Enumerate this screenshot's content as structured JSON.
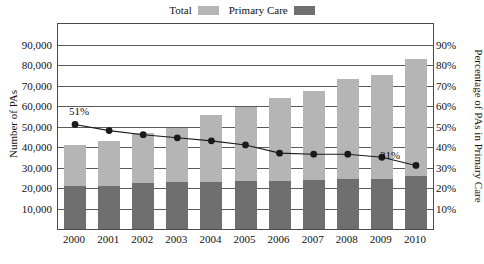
{
  "chart_data": {
    "type": "bar",
    "title": "",
    "subtitle": "",
    "xlabel": "",
    "ylabel": "Number of PAs",
    "ylabel_right": "Percentage of PAs in Primary Care",
    "categories": [
      "2000",
      "2001",
      "2002",
      "2003",
      "2004",
      "2005",
      "2006",
      "2007",
      "2008",
      "2009",
      "2010"
    ],
    "stacked": true,
    "grid": true,
    "legend_position": "top-center",
    "ylim": [
      0,
      100000
    ],
    "yticks": [
      10000,
      20000,
      30000,
      40000,
      50000,
      60000,
      70000,
      80000,
      90000
    ],
    "ytick_labels": [
      "10,000",
      "20,000",
      "30,000",
      "40,000",
      "50,000",
      "60,000",
      "70,000",
      "80,000",
      "90,000"
    ],
    "ylim_right": [
      0,
      100
    ],
    "yticks_right": [
      10,
      20,
      30,
      40,
      50,
      60,
      70,
      80,
      90
    ],
    "ytick_labels_right": [
      "10%",
      "20%",
      "30%",
      "40%",
      "50%",
      "60%",
      "70%",
      "80%",
      "90%"
    ],
    "series": [
      {
        "name": "Total",
        "type": "bar",
        "color": "#b5b5b5",
        "values": [
          41000,
          43000,
          47000,
          49500,
          55500,
          59500,
          64000,
          67500,
          73000,
          75000,
          83000
        ]
      },
      {
        "name": "Primary Care",
        "type": "bar",
        "color": "#6f6f6f",
        "values": [
          21000,
          21000,
          22500,
          23000,
          23000,
          23500,
          23500,
          24000,
          24500,
          24500,
          26000
        ]
      },
      {
        "name": "Percentage in Primary Care",
        "type": "line",
        "axis": "right",
        "color": "#1a1a1a",
        "values": [
          51,
          48,
          46,
          44.5,
          43,
          41,
          37,
          36.5,
          36.5,
          35,
          31
        ]
      }
    ],
    "annotations": [
      {
        "text": "51%",
        "x": "2000",
        "value": 51
      },
      {
        "text": "31%",
        "x": "2010",
        "value": 31
      }
    ]
  },
  "legend": {
    "entries": [
      {
        "label": "Total",
        "color": "#b5b5b5"
      },
      {
        "label": "Primary Care",
        "color": "#6f6f6f"
      }
    ]
  },
  "axes": {
    "left_title": "Number of PAs",
    "right_title": "Percentage of PAs in Primary Care"
  }
}
